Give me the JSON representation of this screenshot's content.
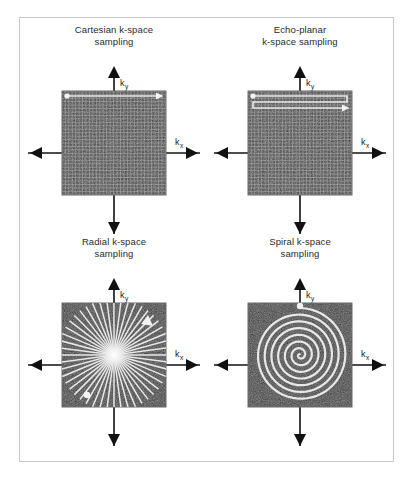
{
  "figure": {
    "border_color": "#c9c9c9",
    "background": "#ffffff"
  },
  "axes": {
    "ky_label": "k",
    "ky_sub": "y",
    "kx_label": "k",
    "kx_sub": "x",
    "line_color": "#111111",
    "arrow_color": "#111111"
  },
  "kspace": {
    "fill_color": "#3a3a3a",
    "trace_color": "#e8e8e8",
    "marker_color": "#f2f2f2"
  },
  "panels": [
    {
      "id": "cartesian",
      "title": "Cartesian k-space\nsampling",
      "trajectory": "cartesian-grid",
      "grid_lines": 30,
      "start_marker": "top-left-dot",
      "end_marker": "top-right-arrow"
    },
    {
      "id": "echo-planar",
      "title": "Echo-planar\nk-space sampling",
      "trajectory": "zigzag-raster",
      "grid_lines": 30,
      "traverses": 3,
      "start_marker": "top-left-dot",
      "end_marker": "right-arrow"
    },
    {
      "id": "radial",
      "title": "Radial k-space\nsampling",
      "trajectory": "radial-spokes",
      "spokes": 24,
      "start_marker": "lower-left-dot",
      "end_marker": "upper-right-arrow"
    },
    {
      "id": "spiral",
      "title": "Spiral k-space\nsampling",
      "trajectory": "archimedean-spiral",
      "turns": 7,
      "start_marker": "top-center-dot",
      "end_marker": "none"
    }
  ]
}
